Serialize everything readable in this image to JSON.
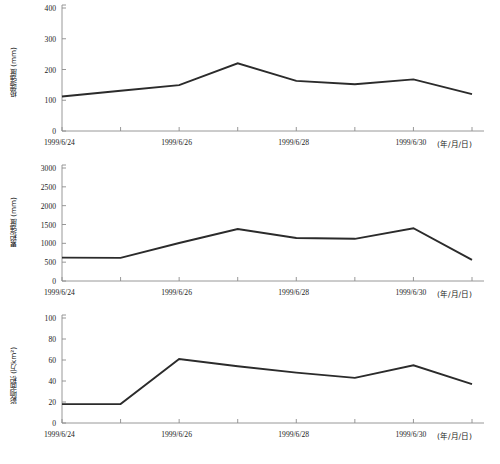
{
  "figure": {
    "background_color": "#ffffff",
    "line_color": "#2b2b2b",
    "axis_color": "#8c8c8c",
    "text_color": "#1a1a1a"
  },
  "x_axis": {
    "tick_labels": [
      "1999/6/24",
      "1999/6/26",
      "1999/6/28",
      "1999/6/30"
    ],
    "unit_label": "(年/月/日)"
  },
  "chart_data": [
    {
      "type": "line",
      "title": "",
      "xlabel": "(年/月/日)",
      "ylabel": "极端强度 (mm)",
      "x": [
        "1999/6/24",
        "1999/6/25",
        "1999/6/26",
        "1999/6/27",
        "1999/6/28",
        "1999/6/29",
        "1999/6/30",
        "1999/7/1"
      ],
      "x_tick_labels": [
        "1999/6/24",
        "1999/6/26",
        "1999/6/28",
        "1999/6/30"
      ],
      "values": [
        112,
        131,
        149,
        220,
        163,
        152,
        168,
        120
      ],
      "y_ticks": [
        0,
        100,
        200,
        300,
        400
      ],
      "ylim": [
        0,
        400
      ],
      "grid": false,
      "legend": "none"
    },
    {
      "type": "line",
      "title": "",
      "xlabel": "(年/月/日)",
      "ylabel": "累积强度 (mm)",
      "x": [
        "1999/6/24",
        "1999/6/25",
        "1999/6/26",
        "1999/6/27",
        "1999/6/28",
        "1999/6/29",
        "1999/6/30",
        "1999/7/1"
      ],
      "x_tick_labels": [
        "1999/6/24",
        "1999/6/26",
        "1999/6/28",
        "1999/6/30"
      ],
      "values": [
        620,
        615,
        1010,
        1380,
        1140,
        1120,
        1400,
        560
      ],
      "y_ticks": [
        0,
        500,
        1000,
        1500,
        2000,
        2500,
        3000
      ],
      "ylim": [
        0,
        3000
      ],
      "grid": false,
      "legend": "none"
    },
    {
      "type": "line",
      "title": "",
      "xlabel": "(年/月/日)",
      "ylabel": "影响面积 (万km²)",
      "x": [
        "1999/6/24",
        "1999/6/25",
        "1999/6/26",
        "1999/6/27",
        "1999/6/28",
        "1999/6/29",
        "1999/6/30",
        "1999/7/1"
      ],
      "x_tick_labels": [
        "1999/6/24",
        "1999/6/26",
        "1999/6/28",
        "1999/6/30"
      ],
      "values": [
        18,
        18,
        61,
        54,
        48,
        43,
        55,
        37
      ],
      "y_ticks": [
        0,
        20,
        40,
        60,
        80,
        100
      ],
      "ylim": [
        0,
        100
      ],
      "grid": false,
      "legend": "none"
    }
  ]
}
